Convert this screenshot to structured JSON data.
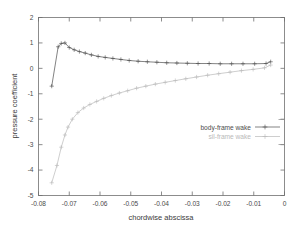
{
  "chart_data": {
    "type": "line",
    "title": "",
    "xlabel": "chordwise abscissa",
    "ylabel": "pressure coefficient",
    "xlim": [
      -0.08,
      0
    ],
    "ylim": [
      -5,
      2
    ],
    "xticks": [
      -0.08,
      -0.07,
      -0.06,
      -0.05,
      -0.04,
      -0.03,
      -0.02,
      -0.01,
      0
    ],
    "xticklabels": [
      "-0.08",
      "-0.07",
      "-0.06",
      "-0.05",
      "-0.04",
      "-0.03",
      "-0.02",
      "-0.01",
      "0"
    ],
    "yticks": [
      2,
      1,
      0,
      -1,
      -2,
      -3,
      -4,
      -5
    ],
    "yticklabels": [
      "2",
      "1",
      "0",
      "-1",
      "-2",
      "-3",
      "-4",
      "-5"
    ],
    "grid": false,
    "legend_position": "lower-right",
    "marker": "plus",
    "series": [
      {
        "name": "body-frame wake",
        "color": "#4d4d4d",
        "x": [
          -0.0757,
          -0.0736,
          -0.0726,
          -0.0714,
          -0.07,
          -0.0684,
          -0.0667,
          -0.0648,
          -0.0628,
          -0.0606,
          -0.0583,
          -0.0558,
          -0.0532,
          -0.0505,
          -0.0476,
          -0.0446,
          -0.0415,
          -0.0383,
          -0.035,
          -0.0316,
          -0.0281,
          -0.0245,
          -0.0209,
          -0.0172,
          -0.0135,
          -0.0097,
          -0.006,
          -0.0045
        ],
        "y": [
          -0.7,
          0.85,
          0.98,
          1.0,
          0.82,
          0.73,
          0.66,
          0.6,
          0.53,
          0.47,
          0.43,
          0.39,
          0.35,
          0.31,
          0.28,
          0.26,
          0.24,
          0.22,
          0.21,
          0.2,
          0.19,
          0.19,
          0.18,
          0.18,
          0.18,
          0.18,
          0.19,
          0.26
        ]
      },
      {
        "name": "sil-frame wake",
        "color": "#b9b9b9",
        "x": [
          -0.0757,
          -0.074,
          -0.0726,
          -0.0714,
          -0.0704,
          -0.069,
          -0.0672,
          -0.0653,
          -0.0633,
          -0.0611,
          -0.0588,
          -0.0563,
          -0.0537,
          -0.051,
          -0.0481,
          -0.0451,
          -0.042,
          -0.0388,
          -0.0355,
          -0.0321,
          -0.0286,
          -0.025,
          -0.0214,
          -0.0177,
          -0.014,
          -0.0102,
          -0.0065,
          -0.0045
        ],
        "y": [
          -4.5,
          -3.82,
          -3.1,
          -2.62,
          -2.31,
          -2.0,
          -1.74,
          -1.56,
          -1.42,
          -1.3,
          -1.18,
          -1.07,
          -0.97,
          -0.88,
          -0.78,
          -0.7,
          -0.62,
          -0.55,
          -0.48,
          -0.41,
          -0.34,
          -0.27,
          -0.21,
          -0.15,
          -0.09,
          -0.04,
          0.02,
          0.13
        ]
      }
    ]
  },
  "legend": {
    "entries": [
      {
        "label": "body-frame wake"
      },
      {
        "label": "sil-frame wake"
      }
    ]
  },
  "colors": {
    "series_body_frame": "#4d4d4d",
    "series_sil_frame": "#b9b9b9",
    "axis": "#707070",
    "text": "#3a3a3a",
    "background": "#ffffff"
  }
}
